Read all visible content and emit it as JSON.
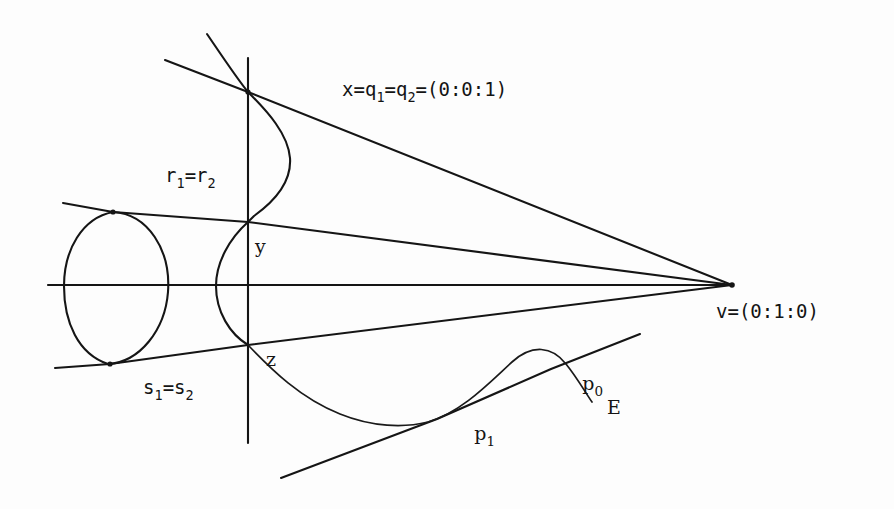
{
  "figure": {
    "kind": "projective-geometry-diagram",
    "background_color": "#fdfdfd",
    "ink_color": "#151515"
  },
  "labels": {
    "x_point": {
      "text": "x=q",
      "sub1": "1",
      "eq1": "=q",
      "sub2": "2",
      "coords": "=(0:0:1)",
      "full": "x=q1=q2=(0:0:1)"
    },
    "r_point": {
      "base1": "r",
      "sub1": "1",
      "eq": "=r",
      "sub2": "2",
      "full": "r1=r2"
    },
    "s_point": {
      "base1": "s",
      "sub1": "1",
      "eq": "=s",
      "sub2": "2",
      "full": "s1=s2"
    },
    "v_point": {
      "text": "v=(0:1:0)",
      "full": "v=(0:1:0)"
    },
    "y_point": {
      "text": "y"
    },
    "z_point": {
      "text": "z"
    },
    "p0_point": {
      "base": "p",
      "sub": "0",
      "full": "p0"
    },
    "p1_point": {
      "base": "p",
      "sub": "1",
      "full": "p1"
    },
    "curve_name": {
      "text": "E"
    }
  },
  "geometry": {
    "vertex_v": {
      "x": 732,
      "y": 285
    },
    "point_x": {
      "x": 248,
      "y": 92
    },
    "point_y": {
      "x": 248,
      "y": 222
    },
    "point_z": {
      "x": 248,
      "y": 345
    },
    "point_r": {
      "x": 113,
      "y": 212
    },
    "point_s": {
      "x": 110,
      "y": 364
    },
    "point_p0": {
      "x": 551,
      "y": 369
    },
    "point_p1": {
      "x": 437,
      "y": 419
    },
    "oval_center": {
      "x": 116,
      "y": 287
    },
    "oval_rx": 52,
    "oval_ry": 76,
    "vertical_line": {
      "x": 248,
      "y_top": 58,
      "y_bottom": 443
    },
    "horizontal_line": {
      "y": 285,
      "x_left": 48,
      "x_right": 732
    }
  }
}
